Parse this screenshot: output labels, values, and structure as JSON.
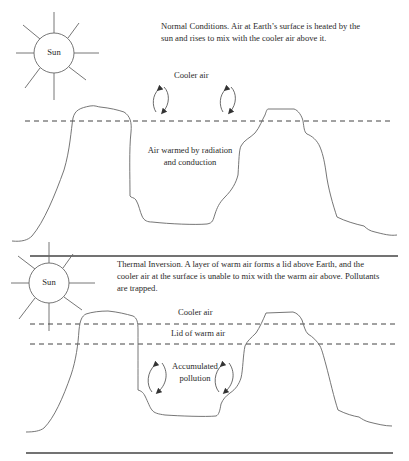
{
  "panels": [
    {
      "id": "normal",
      "sun_label": "Sun",
      "caption": "Normal Conditions. Air at Earth’s surface is heated by the sun and rises to mix with the cooler air above it.",
      "caption_lines": [
        "Normal Conditions. Air at Earth’s surface is heated by the",
        "sun and rises to mix with the cooler air above it."
      ],
      "labels": {
        "upper_air": "Cooler air",
        "lower_air_line1": "Air warmed by radiation",
        "lower_air_line2": "and conduction"
      },
      "layers": [
        "dashed boundary line"
      ],
      "arrows": [
        "circulation-arrow",
        "circulation-arrow"
      ]
    },
    {
      "id": "inversion",
      "sun_label": "Sun",
      "caption": "Thermal Inversion. A layer of warm air forms a lid above Earth, and the cooler air at the surface is unable to mix with the warm air above. Pollutants are trapped.",
      "caption_lines": [
        "Thermal Inversion. A layer of warm air forms a lid above Earth, and the",
        "cooler air at the surface is unable to mix with the warm air above. Pollutants",
        "are trapped."
      ],
      "labels": {
        "upper_air": "Cooler air",
        "lid": "Lid of warm air",
        "trapped_line1": "Accumulated",
        "trapped_line2": "pollution"
      },
      "layers": [
        "dashed boundary line",
        "dashed boundary line"
      ],
      "arrows": [
        "circulation-arrow",
        "circulation-arrow"
      ]
    }
  ],
  "colors": {
    "stroke": "#555555",
    "text": "#2a2a2a",
    "background": "#ffffff"
  }
}
